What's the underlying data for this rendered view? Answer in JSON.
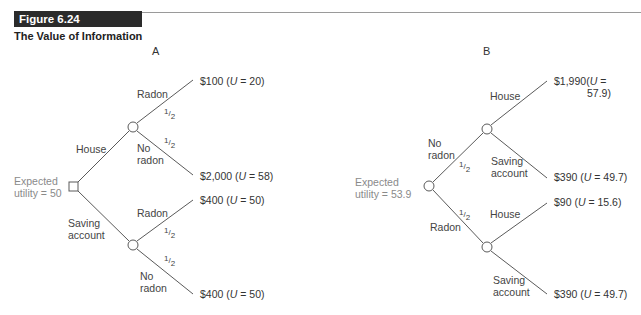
{
  "figure": {
    "number": "Figure 6.24",
    "title": "The Value of Information"
  },
  "panel_a": {
    "label": "A",
    "root": {
      "type": "decision",
      "expected_utility_line1": "Expected",
      "expected_utility_line2": "utility = 50"
    },
    "branches": [
      {
        "choice_line1": "House",
        "choice_line2": "",
        "outcomes": [
          {
            "event_line1": "Radon",
            "event_line2": "",
            "prob": "1/2",
            "payoff": "$100",
            "utility": "20"
          },
          {
            "event_line1": "No",
            "event_line2": "radon",
            "prob": "1/2",
            "payoff": "$2,000",
            "utility": "58"
          }
        ]
      },
      {
        "choice_line1": "Saving",
        "choice_line2": "account",
        "outcomes": [
          {
            "event_line1": "Radon",
            "event_line2": "",
            "prob": "1/2",
            "payoff": "$400",
            "utility": "50"
          },
          {
            "event_line1": "No",
            "event_line2": "radon",
            "prob": "1/2",
            "payoff": "$400",
            "utility": "50"
          }
        ]
      }
    ]
  },
  "panel_b": {
    "label": "B",
    "root": {
      "type": "chance",
      "expected_utility_line1": "Expected",
      "expected_utility_line2": "utility = 53.9"
    },
    "branches": [
      {
        "event_line1": "No",
        "event_line2": "radon",
        "prob": "1/2",
        "outcomes": [
          {
            "choice_line1": "House",
            "choice_line2": "",
            "payoff": "$1,990",
            "utility_line1": "(U =",
            "utility_line2": "57.9)"
          },
          {
            "choice_line1": "Saving",
            "choice_line2": "account",
            "payoff": "$390",
            "utility": "49.7"
          }
        ]
      },
      {
        "event_line1": "Radon",
        "event_line2": "",
        "prob": "1/2",
        "outcomes": [
          {
            "choice_line1": "House",
            "choice_line2": "",
            "payoff": "$90",
            "utility": "15.6"
          },
          {
            "choice_line1": "Saving",
            "choice_line2": "account",
            "payoff": "$390",
            "utility": "49.7"
          }
        ]
      }
    ]
  },
  "labels": {
    "u_open": "(",
    "u_var": "U",
    "u_eq": " = ",
    "u_close": ")",
    "half_num": "1",
    "half_den": "2"
  }
}
